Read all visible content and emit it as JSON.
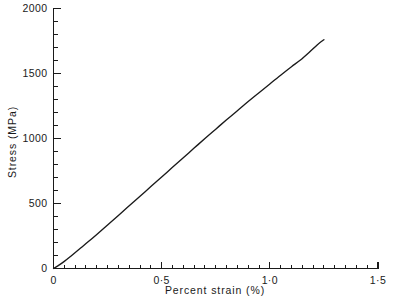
{
  "chart_data": {
    "type": "line",
    "title": "",
    "xlabel": "Percent strain (%)",
    "ylabel": "Stress (MPa)",
    "xlim": [
      0,
      1.5
    ],
    "ylim": [
      0,
      2000
    ],
    "grid": false,
    "legend": null,
    "x_major_ticks": [
      0,
      0.5,
      1.0,
      1.5
    ],
    "x_major_tick_labels": [
      "0",
      "0·5",
      "1·0",
      "1·5"
    ],
    "x_minor_tick_step": 0.05,
    "y_major_ticks": [
      0,
      500,
      1000,
      1500,
      2000
    ],
    "y_major_tick_labels": [
      "0",
      "500",
      "1000",
      "1500",
      "2000"
    ],
    "y_minor_tick_step": 100,
    "series": [
      {
        "name": "stress-strain",
        "x": [
          0.0,
          0.02,
          0.05,
          0.08,
          0.12,
          0.16,
          0.2,
          0.25,
          0.3,
          0.35,
          0.4,
          0.45,
          0.5,
          0.55,
          0.6,
          0.65,
          0.7,
          0.75,
          0.8,
          0.85,
          0.9,
          0.95,
          1.0,
          1.05,
          1.1,
          1.14,
          1.18,
          1.22,
          1.25
        ],
        "y": [
          0,
          20,
          55,
          95,
          150,
          205,
          262,
          335,
          408,
          482,
          556,
          630,
          704,
          778,
          852,
          926,
          1000,
          1072,
          1144,
          1214,
          1284,
          1352,
          1420,
          1487,
          1552,
          1602,
          1660,
          1722,
          1760
        ]
      }
    ]
  },
  "caption": {
    "text": ""
  }
}
